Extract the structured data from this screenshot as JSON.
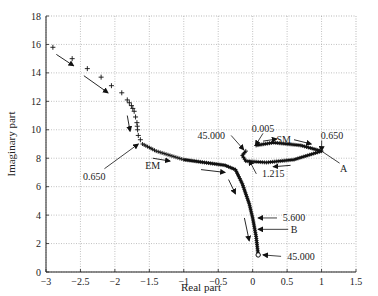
{
  "chart_data": {
    "type": "scatter",
    "title": "",
    "xlabel": "Real part",
    "ylabel": "Imaginary part",
    "xlim": [
      -3,
      1.5
    ],
    "ylim": [
      0,
      18
    ],
    "xticks": [
      -3,
      -2.5,
      -2,
      -1.5,
      -1,
      -0.5,
      0,
      0.5,
      1,
      1.5
    ],
    "xtick_labels": [
      "−3",
      "−2.5",
      "−2",
      "−1.5",
      "−1",
      "−0.5",
      "0",
      "0.5",
      "1",
      "1.5"
    ],
    "yticks": [
      0,
      2,
      4,
      6,
      8,
      10,
      12,
      14,
      16,
      18
    ],
    "ytick_labels": [
      "0",
      "2",
      "4",
      "6",
      "8",
      "10",
      "12",
      "14",
      "16",
      "18"
    ],
    "grid": true,
    "legend": null,
    "series": [
      {
        "name": "EM",
        "marker": "+",
        "points": [
          [
            -2.9,
            15.8
          ],
          [
            -2.62,
            15.0
          ],
          [
            -2.4,
            14.3
          ],
          [
            -2.2,
            13.7
          ],
          [
            -2.05,
            13.1
          ],
          [
            -1.9,
            12.6
          ],
          [
            -1.82,
            12.1
          ],
          [
            -1.76,
            11.7
          ],
          [
            -1.72,
            11.3
          ],
          [
            -1.7,
            10.9
          ],
          [
            -1.68,
            10.5
          ],
          [
            -1.67,
            10.0
          ],
          [
            -1.66,
            9.6
          ],
          [
            -1.6,
            9.0
          ],
          [
            -1.4,
            8.5
          ],
          [
            -1.2,
            8.2
          ],
          [
            -1.0,
            7.9
          ],
          [
            -0.7,
            7.7
          ],
          [
            -0.4,
            7.5
          ],
          [
            -0.25,
            7.2
          ],
          [
            -0.15,
            6.2
          ],
          [
            -0.05,
            4.8
          ],
          [
            0.0,
            3.8
          ],
          [
            0.05,
            2.5
          ],
          [
            0.08,
            1.2
          ]
        ]
      },
      {
        "name": "SM",
        "marker": "+",
        "points": [
          [
            0.05,
            8.9
          ],
          [
            0.3,
            9.1
          ],
          [
            0.7,
            8.9
          ],
          [
            1.0,
            8.5
          ],
          [
            0.6,
            7.9
          ],
          [
            0.2,
            7.7
          ],
          [
            -0.1,
            7.8
          ],
          [
            -0.15,
            8.2
          ],
          [
            -0.1,
            8.5
          ]
        ]
      }
    ],
    "annotations": [
      {
        "text": "0.650",
        "x": -2.3,
        "y": 6.7,
        "arrow_to": [
          -1.66,
          9.0
        ]
      },
      {
        "text": "EM",
        "x": -1.45,
        "y": 7.5
      },
      {
        "text": "45.000",
        "x": -0.6,
        "y": 9.6,
        "arrow_to": [
          -0.13,
          8.6
        ]
      },
      {
        "text": "0.005",
        "x": 0.15,
        "y": 10.1,
        "arrow_to": [
          0.04,
          8.9
        ]
      },
      {
        "text": "SM",
        "x": 0.45,
        "y": 9.3
      },
      {
        "text": "0.650",
        "x": 1.15,
        "y": 9.6,
        "arrow_to": [
          1.0,
          8.5
        ]
      },
      {
        "text": "A",
        "x": 1.32,
        "y": 7.3,
        "arrow_from": [
          1.0,
          8.5
        ]
      },
      {
        "text": "1.215",
        "x": 0.3,
        "y": 6.9,
        "arrow_to": [
          -0.05,
          7.85
        ]
      },
      {
        "text": "5.600",
        "x": 0.6,
        "y": 3.8,
        "arrow_to": [
          0.08,
          3.8
        ]
      },
      {
        "text": "B",
        "x": 0.6,
        "y": 3.0,
        "arrow_to": [
          0.08,
          3.0
        ]
      },
      {
        "text": "45.000",
        "x": 0.7,
        "y": 1.1,
        "arrow_to": [
          0.15,
          1.2
        ]
      }
    ]
  }
}
